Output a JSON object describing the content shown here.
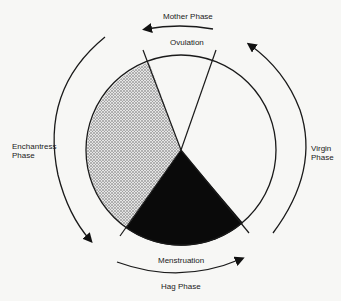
{
  "diagram": {
    "labels": {
      "mother": "Mother Phase",
      "ovulation": "Ovulation",
      "enchantress_1": "Enchantress",
      "enchantress_2": "Phase",
      "virgin_1": "Virgin",
      "virgin_2": "Phase",
      "menstruation": "Menstruation",
      "hag": "Hag Phase"
    },
    "colors": {
      "line": "#1a1a1a",
      "dark": "#0a0a0a",
      "stipple": "#bdbdbd",
      "background": "#f7f7f5"
    }
  }
}
